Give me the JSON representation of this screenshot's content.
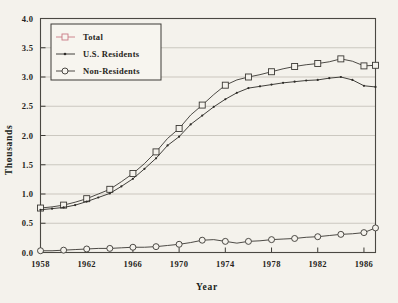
{
  "chart_data": {
    "type": "line",
    "title": "",
    "xlabel": "Year",
    "ylabel": "Thousands",
    "xlim": [
      1958,
      1987
    ],
    "ylim": [
      0.0,
      4.0
    ],
    "grid": true,
    "legend_position": "top-left",
    "xticks": [
      "1958",
      "1962",
      "1966",
      "1970",
      "1974",
      "1978",
      "1982",
      "1986"
    ],
    "xtick_values": [
      1958,
      1962,
      1966,
      1970,
      1974,
      1978,
      1982,
      1986
    ],
    "yticks": [
      "0.0",
      "0.5",
      "1.0",
      "1.5",
      "2.0",
      "2.5",
      "3.0",
      "3.5",
      "4.0"
    ],
    "ytick_values": [
      0.0,
      0.5,
      1.0,
      1.5,
      2.0,
      2.5,
      3.0,
      3.5,
      4.0
    ],
    "x": [
      1958,
      1959,
      1960,
      1961,
      1962,
      1963,
      1964,
      1965,
      1966,
      1967,
      1968,
      1969,
      1970,
      1971,
      1972,
      1973,
      1974,
      1975,
      1976,
      1977,
      1978,
      1979,
      1980,
      1981,
      1982,
      1983,
      1984,
      1985,
      1986,
      1987
    ],
    "series": [
      {
        "name": "Total",
        "marker": "square",
        "color": "#3a3833",
        "legend_color": "#c87a85",
        "marker_years": [
          1958,
          1960,
          1962,
          1964,
          1966,
          1968,
          1970,
          1972,
          1974,
          1976,
          1978,
          1980,
          1982,
          1984,
          1986,
          1987
        ],
        "values": [
          0.76,
          0.78,
          0.81,
          0.86,
          0.92,
          1.0,
          1.08,
          1.21,
          1.35,
          1.52,
          1.72,
          1.95,
          2.12,
          2.35,
          2.52,
          2.7,
          2.86,
          2.95,
          3.0,
          3.04,
          3.09,
          3.14,
          3.18,
          3.21,
          3.23,
          3.26,
          3.31,
          3.27,
          3.19,
          3.2
        ]
      },
      {
        "name": "U.S. Residents",
        "marker": "dot",
        "color": "#2e2c28",
        "legend_color": "#2e2c28",
        "marker_years": [],
        "values": [
          0.73,
          0.75,
          0.77,
          0.81,
          0.87,
          0.94,
          1.01,
          1.13,
          1.26,
          1.43,
          1.61,
          1.83,
          1.98,
          2.19,
          2.34,
          2.49,
          2.62,
          2.73,
          2.81,
          2.84,
          2.87,
          2.9,
          2.92,
          2.94,
          2.95,
          2.98,
          3.0,
          2.95,
          2.85,
          2.83
        ]
      },
      {
        "name": "Non-Residents",
        "marker": "circle",
        "color": "#3a3833",
        "legend_color": "#3a3833",
        "marker_years": [
          1958,
          1960,
          1962,
          1964,
          1966,
          1968,
          1970,
          1972,
          1974,
          1976,
          1978,
          1980,
          1982,
          1984,
          1986,
          1987
        ],
        "values": [
          0.03,
          0.03,
          0.04,
          0.05,
          0.06,
          0.07,
          0.07,
          0.08,
          0.09,
          0.09,
          0.1,
          0.12,
          0.14,
          0.17,
          0.21,
          0.22,
          0.19,
          0.16,
          0.19,
          0.2,
          0.22,
          0.23,
          0.24,
          0.26,
          0.27,
          0.29,
          0.31,
          0.32,
          0.34,
          0.42
        ]
      }
    ]
  },
  "legend": {
    "entries": [
      {
        "label": "Total"
      },
      {
        "label": "U.S. Residents"
      },
      {
        "label": "Non-Residents"
      }
    ]
  }
}
